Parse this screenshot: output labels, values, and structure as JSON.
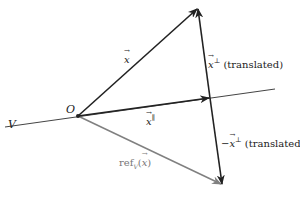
{
  "diagram": {
    "colors": {
      "dark": "#222222",
      "gray": "#808080",
      "background": "#ffffff"
    },
    "labels": {
      "line_V": "V",
      "origin": "O",
      "vector_x": "x",
      "vector_x_parallel_base": "x",
      "vector_x_parallel_sup": "∥",
      "perp_base": "x",
      "perp_sup": "⊥",
      "perp_suffix": " (translated)",
      "neg_perp_prefix": "−",
      "neg_perp_base": "x",
      "neg_perp_sup": "⊥",
      "neg_perp_suffix": " (translated)",
      "ref_prefix": "ref",
      "ref_sub": "V",
      "ref_open": "(",
      "ref_arg": "x",
      "ref_close": ")"
    },
    "points": {
      "O": [
        78,
        116
      ],
      "x_tip": [
        198,
        8
      ],
      "x_parallel_tip": [
        210,
        98
      ],
      "ref_tip": [
        222,
        185
      ],
      "V_start": [
        5,
        127
      ],
      "V_end": [
        275,
        89
      ]
    }
  }
}
